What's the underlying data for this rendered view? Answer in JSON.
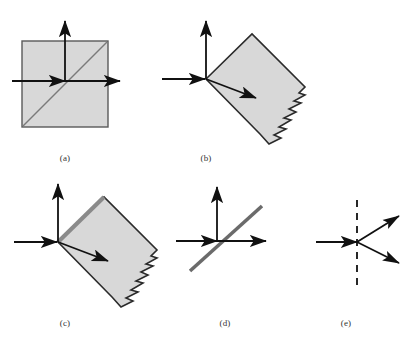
{
  "figure": {
    "width": 416,
    "height": 350,
    "background": "#ffffff",
    "colors": {
      "block_fill": "#d8d8d8",
      "block_stroke": "#2b2b2b",
      "axis_stroke": "#1a1a1a",
      "diagonal_gray": "#6b6b6b",
      "thick_edge_gray": "#8a8a8a",
      "label_text": "#333333",
      "dashed_line": "#111111"
    },
    "panels": [
      {
        "id": "a",
        "label": "(a)",
        "label_x": 65,
        "label_y": 158,
        "description": "Axis-aligned square block with horizontal and vertical axis arrows meeting at the origin, plus a gray diagonal running corner to corner",
        "elements": {
          "square": {
            "x": 22,
            "y": 41,
            "width": 86,
            "height": 86
          },
          "origin": {
            "x": 65,
            "y": 81
          },
          "h_axis": {
            "x1": 12,
            "y1": 81,
            "x2": 122,
            "y2": 81
          },
          "v_axis": {
            "x1": 65,
            "y1": 81,
            "x2": 65,
            "y2": 20
          },
          "inner_arrow": {
            "x1": 40,
            "y1": 81,
            "x2": 66,
            "y2": 81
          },
          "diagonal": {
            "x1": 24,
            "y1": 125,
            "x2": 106,
            "y2": 43
          }
        }
      },
      {
        "id": "b",
        "label": "(b)",
        "label_x": 206,
        "label_y": 158,
        "description": "Square block rotated about 45 degrees with a torn sawtooth edge along the lower-right side; axes arrows meet at the block's upper-left corner and a slanted arrow points into the block",
        "elements": {
          "origin": {
            "x": 206,
            "y": 79
          },
          "h_axis": {
            "x1": 162,
            "y1": 79,
            "x2": 207,
            "y2": 79
          },
          "v_axis": {
            "x1": 206,
            "y1": 79,
            "x2": 206,
            "y2": 20
          },
          "block_corners": [
            {
              "x": 206,
              "y": 79
            },
            {
              "x": 252,
              "y": 34
            },
            {
              "x": 306,
              "y": 88
            },
            {
              "x": 260,
              "y": 133
            }
          ],
          "ray_arrow": {
            "x1": 206,
            "y1": 79,
            "x2": 258,
            "y2": 99
          },
          "jagged_edge": "lower-right",
          "jagged_teeth": 9
        }
      },
      {
        "id": "c",
        "label": "(c)",
        "label_x": 65,
        "label_y": 323,
        "description": "Same rotated torn block as (b) but the upper-left face is drawn as a thick gray boundary layer",
        "elements": {
          "origin": {
            "x": 58,
            "y": 242
          },
          "h_axis": {
            "x1": 14,
            "y1": 242,
            "x2": 59,
            "y2": 242
          },
          "v_axis": {
            "x1": 58,
            "y1": 242,
            "x2": 58,
            "y2": 183
          },
          "block_corners": [
            {
              "x": 58,
              "y": 242
            },
            {
              "x": 104,
              "y": 197
            },
            {
              "x": 158,
              "y": 251
            },
            {
              "x": 112,
              "y": 296
            }
          ],
          "thick_edge": {
            "x1": 58,
            "y1": 242,
            "x2": 104,
            "y2": 197
          },
          "ray_arrow": {
            "x1": 58,
            "y1": 242,
            "x2": 110,
            "y2": 262
          },
          "jagged_edge": "lower-right",
          "jagged_teeth": 9
        }
      },
      {
        "id": "d",
        "label": "(d)",
        "label_x": 225,
        "label_y": 323,
        "description": "Coordinate axes alone with a thick gray straight line through the origin at roughly 40 degrees",
        "elements": {
          "origin": {
            "x": 217,
            "y": 241
          },
          "h_axis": {
            "x1": 176,
            "y1": 241,
            "x2": 268,
            "y2": 241
          },
          "v_axis": {
            "x1": 217,
            "y1": 241,
            "x2": 217,
            "y2": 186
          },
          "inner_arrow": {
            "x1": 192,
            "y1": 241,
            "x2": 218,
            "y2": 241
          },
          "gray_line": {
            "x1": 190,
            "y1": 270,
            "x2": 262,
            "y2": 207
          }
        }
      },
      {
        "id": "e",
        "label": "(e)",
        "label_x": 346,
        "label_y": 323,
        "description": "Dashed vertical boundary with one incoming horizontal arrow from the left and two outgoing arrows to the upper right and lower right",
        "elements": {
          "boundary_point": {
            "x": 357,
            "y": 242
          },
          "dashed_line": {
            "x1": 357,
            "y1": 200,
            "x2": 357,
            "y2": 285
          },
          "incident_arrow": {
            "x1": 316,
            "y1": 242,
            "x2": 358,
            "y2": 242
          },
          "out_arrow_upper": {
            "x1": 357,
            "y1": 242,
            "x2": 400,
            "y2": 217
          },
          "out_arrow_lower": {
            "x1": 357,
            "y1": 242,
            "x2": 400,
            "y2": 263
          }
        }
      }
    ]
  }
}
